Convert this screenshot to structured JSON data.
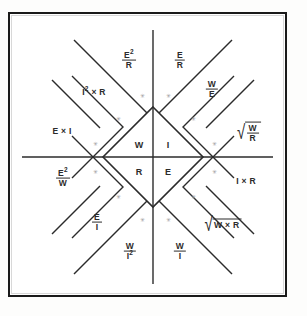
{
  "diagram": {
    "type": "ohms-law-wheel",
    "line_color": "#2b2b2b",
    "border_color": "#1a1a1a",
    "background_color": "#ffffff",
    "marker_color": "#9a9a9a",
    "center": {
      "quadrants": [
        {
          "id": "power",
          "symbol": "W",
          "position": "upper-left"
        },
        {
          "id": "current",
          "symbol": "I",
          "position": "upper-right"
        },
        {
          "id": "resistance",
          "symbol": "R",
          "position": "lower-left"
        },
        {
          "id": "voltage",
          "symbol": "E",
          "position": "lower-right"
        }
      ]
    },
    "sectors": [
      {
        "id": "w-e2-over-r",
        "group": "power",
        "kind": "fraction",
        "numerator": "E",
        "numerator_exp": "2",
        "denominator": "R",
        "text": "E²/R"
      },
      {
        "id": "i-e-over-r",
        "group": "current",
        "kind": "fraction",
        "numerator": "E",
        "denominator": "R",
        "text": "E/R"
      },
      {
        "id": "w-i2-x-r",
        "group": "power",
        "kind": "product",
        "text": "I² × R",
        "left": "I",
        "left_exp": "2",
        "right": "R"
      },
      {
        "id": "i-w-over-e",
        "group": "current",
        "kind": "fraction",
        "numerator": "W",
        "denominator": "E",
        "text": "W/E"
      },
      {
        "id": "w-e-x-i",
        "group": "power",
        "kind": "product",
        "text": "E × I",
        "left": "E",
        "right": "I"
      },
      {
        "id": "i-sqrt-w-r",
        "group": "current",
        "kind": "sqrt-fraction",
        "numerator": "W",
        "denominator": "R",
        "text": "√(W/R)"
      },
      {
        "id": "r-e2-over-w",
        "group": "resistance",
        "kind": "fraction",
        "numerator": "E",
        "numerator_exp": "2",
        "denominator": "W",
        "text": "E²/W"
      },
      {
        "id": "e-i-x-r",
        "group": "voltage",
        "kind": "product",
        "text": "I × R",
        "left": "I",
        "right": "R"
      },
      {
        "id": "r-e-over-i",
        "group": "resistance",
        "kind": "fraction",
        "numerator": "E",
        "denominator": "I",
        "text": "E/I"
      },
      {
        "id": "e-sqrt-w-x-r",
        "group": "voltage",
        "kind": "sqrt-product",
        "text": "√(W × R)",
        "left": "W",
        "right": "R"
      },
      {
        "id": "r-w-over-i2",
        "group": "resistance",
        "kind": "fraction",
        "numerator": "W",
        "denominator": "I",
        "denominator_exp": "2",
        "text": "W/I²"
      },
      {
        "id": "e-w-over-i",
        "group": "voltage",
        "kind": "fraction",
        "numerator": "W",
        "denominator": "I",
        "text": "W/I"
      }
    ],
    "markers": {
      "glyph": "✳",
      "count": 12
    }
  }
}
